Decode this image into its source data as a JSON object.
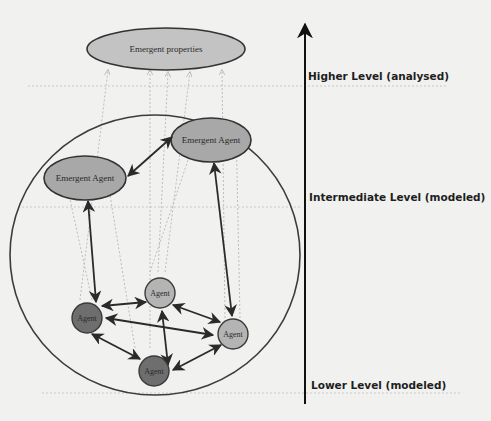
{
  "diagram": {
    "type": "multi-level agent-based emergence diagram",
    "levels": [
      {
        "id": "higher",
        "label": "Higher Level (analysed)",
        "y": 86
      },
      {
        "id": "intermediate",
        "label": "Intermediate Level (modeled)",
        "y": 207
      },
      {
        "id": "lower",
        "label": "Lower Level (modeled)",
        "y": 392
      }
    ],
    "emergent_properties": {
      "label": "Emergent properties",
      "fill": "#c3c3c3"
    },
    "emergent_agents": [
      {
        "id": "ea1",
        "label": "Emergent Agent",
        "fill": "#a8a8a8"
      },
      {
        "id": "ea2",
        "label": "Emergent Agent",
        "fill": "#a8a8a8"
      }
    ],
    "agents": [
      {
        "id": "a1",
        "label": "Agent",
        "shade": "dark",
        "fill": "#6e6e6e"
      },
      {
        "id": "a2",
        "label": "Agent",
        "shade": "light",
        "fill": "#b4b4b4"
      },
      {
        "id": "a3",
        "label": "Agent",
        "shade": "light",
        "fill": "#b4b4b4"
      },
      {
        "id": "a4",
        "label": "Agent",
        "shade": "dark",
        "fill": "#6e6e6e"
      }
    ],
    "edges": [
      {
        "from": "a1",
        "to": "a2",
        "style": "bidirectional"
      },
      {
        "from": "a1",
        "to": "a3",
        "style": "bidirectional"
      },
      {
        "from": "a1",
        "to": "a4",
        "style": "bidirectional"
      },
      {
        "from": "a2",
        "to": "a3",
        "style": "bidirectional"
      },
      {
        "from": "a2",
        "to": "a4",
        "style": "bidirectional"
      },
      {
        "from": "a3",
        "to": "a4",
        "style": "bidirectional"
      },
      {
        "from": "ea1",
        "to": "ea2",
        "style": "bidirectional"
      },
      {
        "from": "ea1",
        "to": "a1",
        "style": "bidirectional"
      },
      {
        "from": "ea2",
        "to": "a3",
        "style": "bidirectional"
      }
    ],
    "colors": {
      "background": "#f1f1f0",
      "stroke": "#3a3a3a",
      "dotted": "#b9b9b9"
    }
  }
}
